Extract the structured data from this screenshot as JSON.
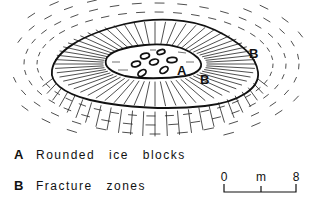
{
  "figure": {
    "labels": {
      "outer_b": "B",
      "inner_a": "A",
      "inner_b": "B"
    }
  },
  "legend": {
    "items": [
      {
        "key": "A",
        "text": "Rounded ice blocks"
      },
      {
        "key": "B",
        "text": "Fracture zones"
      }
    ]
  },
  "scale_bar": {
    "start": "0",
    "unit": "m",
    "end": "8"
  },
  "colors": {
    "ink": "#111111",
    "background": "#ffffff"
  }
}
